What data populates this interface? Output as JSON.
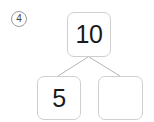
{
  "worksheet": {
    "problem_number": "4",
    "marker_icon": "circled-number-icon",
    "number_bond": {
      "whole": {
        "label": "whole-box",
        "value": "10",
        "filled": true
      },
      "parts": [
        {
          "label": "part-box-left",
          "value": "5",
          "filled": true
        },
        {
          "label": "part-box-right",
          "value": "",
          "filled": false
        }
      ],
      "connector_icon": "v-branch-connector-icon"
    }
  },
  "colors": {
    "background": "#ffffff",
    "box_border": "#cfcfcf",
    "connector_line": "#b5b5b5",
    "marker_border": "#9a9a9a",
    "digit_text": "#1a1a1a",
    "marker_text": "#444444"
  }
}
